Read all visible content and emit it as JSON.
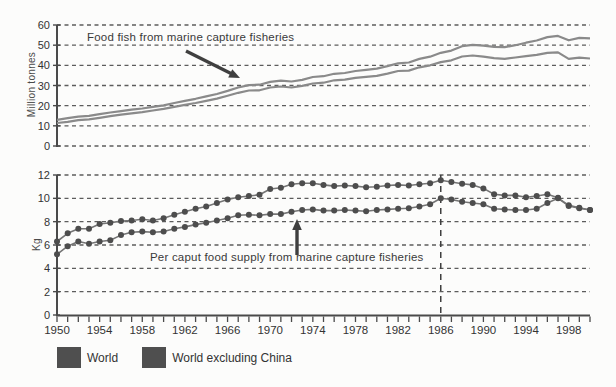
{
  "figure": {
    "top_chart": {
      "title": "Food fish from marine capture fisheries",
      "ylabel": "Million tonnes",
      "y_ticks": [
        0,
        10,
        20,
        30,
        40,
        50,
        60
      ]
    },
    "bottom_chart": {
      "annotation": "Per caput food supply from marine capture fisheries",
      "ylabel": "Kg",
      "y_ticks": [
        0,
        2,
        4,
        6,
        8,
        10,
        12
      ],
      "x_tick_labels": [
        1950,
        1954,
        1958,
        1962,
        1966,
        1970,
        1974,
        1978,
        1982,
        1986,
        1990,
        1994,
        1998
      ],
      "reference_line_year": 1986
    },
    "legend": [
      {
        "label": "World",
        "color": "#4f4f4f"
      },
      {
        "label": "World excluding China",
        "color": "#4f4f4f"
      }
    ],
    "colors": {
      "grid": "#5c5c5c",
      "axis": "#4a4a4a",
      "top_line": "#8a8a8a",
      "bottom_line": "#757575",
      "marker": "#4d4d4d",
      "text": "#333333",
      "arrow": "#3f3f3f"
    }
  },
  "chart_data": [
    {
      "type": "line",
      "title": "Food fish from marine capture fisheries",
      "ylabel": "Million tonnes",
      "ylim": [
        0,
        60
      ],
      "grid": "horizontal-dashed",
      "markers": false,
      "x": [
        1950,
        1951,
        1952,
        1953,
        1954,
        1955,
        1956,
        1957,
        1958,
        1959,
        1960,
        1961,
        1962,
        1963,
        1964,
        1965,
        1966,
        1967,
        1968,
        1969,
        1970,
        1971,
        1972,
        1973,
        1974,
        1975,
        1976,
        1977,
        1978,
        1979,
        1980,
        1981,
        1982,
        1983,
        1984,
        1985,
        1986,
        1987,
        1988,
        1989,
        1990,
        1991,
        1992,
        1993,
        1994,
        1995,
        1996,
        1997,
        1998,
        1999,
        2000
      ],
      "series": [
        {
          "name": "World",
          "values": [
            13.0,
            13.8,
            14.6,
            15.0,
            15.8,
            16.6,
            17.3,
            18.0,
            18.6,
            19.4,
            20.2,
            21.3,
            22.4,
            23.4,
            24.6,
            25.8,
            27.3,
            29.0,
            30.2,
            30.4,
            31.8,
            32.4,
            32.0,
            32.8,
            34.2,
            34.6,
            35.8,
            36.2,
            37.2,
            37.8,
            38.4,
            39.6,
            41.0,
            41.4,
            43.2,
            44.3,
            46.2,
            47.3,
            49.5,
            50.2,
            49.8,
            49.2,
            49.0,
            50.0,
            51.2,
            52.3,
            54.0,
            54.6,
            52.4,
            53.6,
            53.4
          ]
        },
        {
          "name": "World excluding China",
          "values": [
            11.4,
            12.0,
            12.8,
            13.2,
            14.0,
            14.8,
            15.5,
            16.2,
            16.8,
            17.6,
            18.4,
            19.4,
            20.4,
            21.3,
            22.4,
            23.5,
            24.9,
            26.4,
            27.5,
            27.6,
            29.0,
            29.5,
            29.0,
            29.8,
            31.0,
            31.4,
            32.6,
            32.9,
            33.8,
            34.3,
            34.8,
            35.9,
            37.2,
            37.4,
            39.0,
            40.0,
            41.6,
            42.5,
            44.4,
            44.9,
            44.3,
            43.6,
            43.2,
            43.9,
            44.6,
            45.2,
            46.2,
            46.4,
            43.2,
            43.8,
            43.4
          ]
        }
      ]
    },
    {
      "type": "line",
      "title": "Per caput food supply from marine capture fisheries",
      "ylabel": "Kg",
      "ylim": [
        0,
        12
      ],
      "grid": "horizontal-dashed",
      "markers": true,
      "vline_x": 1986,
      "x": [
        1950,
        1951,
        1952,
        1953,
        1954,
        1955,
        1956,
        1957,
        1958,
        1959,
        1960,
        1961,
        1962,
        1963,
        1964,
        1965,
        1966,
        1967,
        1968,
        1969,
        1970,
        1971,
        1972,
        1973,
        1974,
        1975,
        1976,
        1977,
        1978,
        1979,
        1980,
        1981,
        1982,
        1983,
        1984,
        1985,
        1986,
        1987,
        1988,
        1989,
        1990,
        1991,
        1992,
        1993,
        1994,
        1995,
        1996,
        1997,
        1998,
        1999,
        2000
      ],
      "series": [
        {
          "name": "World excluding China",
          "values": [
            6.3,
            7.0,
            7.4,
            7.4,
            7.8,
            7.9,
            8.05,
            8.1,
            8.2,
            8.1,
            8.3,
            8.6,
            8.85,
            9.1,
            9.3,
            9.6,
            9.9,
            10.1,
            10.2,
            10.3,
            10.8,
            10.9,
            11.2,
            11.3,
            11.3,
            11.15,
            11.05,
            11.1,
            11.05,
            10.95,
            11.0,
            11.1,
            11.15,
            11.1,
            11.2,
            11.3,
            11.55,
            11.4,
            11.25,
            11.15,
            10.85,
            10.35,
            10.25,
            10.25,
            10.1,
            10.2,
            10.35,
            10.05,
            9.4,
            9.2,
            9.0
          ]
        },
        {
          "name": "World",
          "values": [
            5.2,
            5.9,
            6.3,
            6.1,
            6.3,
            6.4,
            6.85,
            7.1,
            7.15,
            7.1,
            7.15,
            7.4,
            7.55,
            7.75,
            7.9,
            8.1,
            8.3,
            8.55,
            8.6,
            8.55,
            8.65,
            8.65,
            8.85,
            9.0,
            9.05,
            8.95,
            8.95,
            9.0,
            8.95,
            8.9,
            9.0,
            9.05,
            9.1,
            9.15,
            9.3,
            9.5,
            10.0,
            9.9,
            9.7,
            9.6,
            9.5,
            9.1,
            9.05,
            9.0,
            9.0,
            9.1,
            9.6,
            10.0,
            9.35,
            9.15,
            9.0
          ]
        }
      ]
    }
  ]
}
